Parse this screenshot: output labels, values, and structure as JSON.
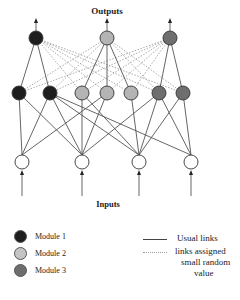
{
  "diagram": {
    "outputs_label": "Outputs",
    "inputs_label": "Inputs",
    "colors": {
      "module1": "#1e1e1e",
      "module2": "#b4b4b4",
      "module3": "#6e6e6e",
      "input": "#ffffff",
      "link": "#555555"
    },
    "output_nodes": [
      {
        "id": "O1",
        "x": 36,
        "y": 38,
        "module": 1
      },
      {
        "id": "O2",
        "x": 107,
        "y": 38,
        "module": 2
      },
      {
        "id": "O3",
        "x": 170,
        "y": 38,
        "module": 3
      }
    ],
    "hidden_nodes": [
      {
        "id": "H1",
        "x": 19,
        "y": 93,
        "module": 1
      },
      {
        "id": "H2",
        "x": 50,
        "y": 93,
        "module": 1
      },
      {
        "id": "H3",
        "x": 82,
        "y": 93,
        "module": 2
      },
      {
        "id": "H4",
        "x": 107,
        "y": 93,
        "module": 2
      },
      {
        "id": "H5",
        "x": 131,
        "y": 93,
        "module": 2
      },
      {
        "id": "H6",
        "x": 159,
        "y": 93,
        "module": 3
      },
      {
        "id": "H7",
        "x": 183,
        "y": 93,
        "module": 3
      }
    ],
    "input_nodes": [
      {
        "id": "I1",
        "x": 22,
        "y": 162
      },
      {
        "id": "I2",
        "x": 82,
        "y": 162
      },
      {
        "id": "I3",
        "x": 139,
        "y": 162
      },
      {
        "id": "I4",
        "x": 191,
        "y": 162
      }
    ],
    "usual_links_out": [
      [
        "O1",
        "H1"
      ],
      [
        "O1",
        "H2"
      ],
      [
        "O2",
        "H3"
      ],
      [
        "O2",
        "H4"
      ],
      [
        "O2",
        "H5"
      ],
      [
        "O3",
        "H6"
      ],
      [
        "O3",
        "H7"
      ]
    ],
    "random_links_out": [
      [
        "O1",
        "H3"
      ],
      [
        "O1",
        "H4"
      ],
      [
        "O1",
        "H5"
      ],
      [
        "O1",
        "H6"
      ],
      [
        "O1",
        "H7"
      ],
      [
        "O2",
        "H1"
      ],
      [
        "O2",
        "H2"
      ],
      [
        "O2",
        "H6"
      ],
      [
        "O2",
        "H7"
      ],
      [
        "O3",
        "H1"
      ],
      [
        "O3",
        "H2"
      ],
      [
        "O3",
        "H3"
      ],
      [
        "O3",
        "H4"
      ],
      [
        "O3",
        "H5"
      ]
    ],
    "usual_links_in": [
      [
        "I1",
        "H1"
      ],
      [
        "I1",
        "H2"
      ],
      [
        "I1",
        "H4"
      ],
      [
        "I2",
        "H1"
      ],
      [
        "I2",
        "H2"
      ],
      [
        "I2",
        "H3"
      ],
      [
        "I2",
        "H4"
      ],
      [
        "I2",
        "H6"
      ],
      [
        "I3",
        "H2"
      ],
      [
        "I3",
        "H3"
      ],
      [
        "I3",
        "H5"
      ],
      [
        "I3",
        "H6"
      ],
      [
        "I3",
        "H7"
      ],
      [
        "I4",
        "H2"
      ],
      [
        "I4",
        "H6"
      ],
      [
        "I4",
        "H7"
      ]
    ]
  },
  "legend": {
    "modules": [
      {
        "label": "Module 1",
        "color": "#1e1e1e"
      },
      {
        "label": "Module 2",
        "color": "#c4c4c4"
      },
      {
        "label": "Module 3",
        "color": "#6e6e6e"
      }
    ],
    "usual_links": "Usual links",
    "random_links": [
      "links assigned",
      "small random",
      "value"
    ]
  }
}
